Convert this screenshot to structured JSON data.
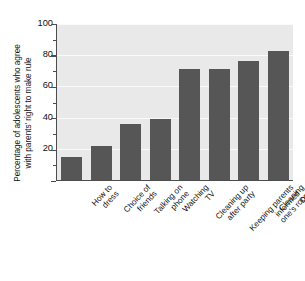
{
  "chart_data": {
    "type": "bar",
    "title": "",
    "subtitle": "",
    "xlabel": "",
    "ylabel": "Percentage of adolescents who agree with parents' right to make rule",
    "ylabel_lines": [
      "Percentage of adolescents who agree",
      "with parents' right to make rule"
    ],
    "categories": [
      "How to dress",
      "Choice of friends",
      "Talking on phone",
      "Watching TV",
      "Cleaning up after party",
      "Keeping parents informed",
      "Cleaning one's room",
      "Doing chores"
    ],
    "category_lines": [
      [
        "How to",
        "dress"
      ],
      [
        "Choice of",
        "friends"
      ],
      [
        "Talking on",
        "phone"
      ],
      [
        "Watching",
        "TV"
      ],
      [
        "Cleaning up",
        "after party"
      ],
      [
        "Keeping parents",
        "informed"
      ],
      [
        "Cleaning",
        "one's room"
      ],
      [
        "Doing",
        "chores"
      ]
    ],
    "values": [
      15,
      22,
      36,
      39,
      71,
      71,
      76,
      83
    ],
    "ylim": [
      0,
      100
    ],
    "ytick_major": [
      0,
      20,
      40,
      60,
      80,
      100
    ],
    "ytick_labels": [
      "20",
      "40",
      "60",
      "80",
      "100"
    ],
    "ytick_minor": [
      10,
      30,
      50,
      70,
      90
    ],
    "grid": true,
    "gridlines_at": [
      20,
      40,
      60,
      80,
      100
    ],
    "legend": "none",
    "bar_color": "#565656",
    "plot_background": "#e9e9e9",
    "gridline_color": "#fafafa",
    "axis_color": "#4d4d4d",
    "figure_background": "#ffffff"
  }
}
